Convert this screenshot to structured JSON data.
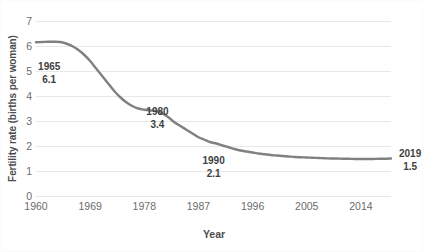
{
  "chart_data": {
    "type": "line",
    "title": "",
    "xlabel": "Year",
    "ylabel": "Fertility rate (births per woman)",
    "xlim": [
      1960,
      2019
    ],
    "ylim": [
      0,
      7
    ],
    "grid": true,
    "legend": false,
    "line_color": "#808080",
    "gridline_color": "#e8e8e8",
    "x_ticks": [
      1960,
      1969,
      1978,
      1987,
      1996,
      2005,
      2014
    ],
    "y_ticks": [
      0,
      1,
      2,
      3,
      4,
      5,
      6,
      7
    ],
    "x": [
      1960,
      1961,
      1962,
      1963,
      1964,
      1965,
      1966,
      1967,
      1968,
      1969,
      1970,
      1971,
      1972,
      1973,
      1974,
      1975,
      1976,
      1977,
      1978,
      1979,
      1980,
      1981,
      1982,
      1983,
      1984,
      1985,
      1986,
      1987,
      1988,
      1989,
      1990,
      1991,
      1992,
      1993,
      1994,
      1995,
      1996,
      1997,
      1998,
      1999,
      2000,
      2001,
      2002,
      2003,
      2004,
      2005,
      2006,
      2007,
      2008,
      2009,
      2010,
      2011,
      2012,
      2013,
      2014,
      2015,
      2016,
      2017,
      2018,
      2019
    ],
    "values": [
      6.15,
      6.16,
      6.17,
      6.17,
      6.16,
      6.1,
      6.0,
      5.85,
      5.65,
      5.4,
      5.1,
      4.8,
      4.5,
      4.2,
      3.95,
      3.75,
      3.6,
      3.5,
      3.45,
      3.42,
      3.4,
      3.3,
      3.15,
      2.95,
      2.8,
      2.65,
      2.5,
      2.35,
      2.25,
      2.15,
      2.1,
      2.02,
      1.95,
      1.88,
      1.82,
      1.78,
      1.74,
      1.7,
      1.67,
      1.64,
      1.62,
      1.6,
      1.58,
      1.56,
      1.55,
      1.54,
      1.53,
      1.52,
      1.51,
      1.5,
      1.5,
      1.49,
      1.49,
      1.48,
      1.48,
      1.48,
      1.48,
      1.49,
      1.49,
      1.5
    ],
    "annotations": [
      {
        "year": "1965",
        "value": "6.1"
      },
      {
        "year": "1980",
        "value": "3.4"
      },
      {
        "year": "1990",
        "value": "2.1"
      },
      {
        "year": "2019",
        "value": "1.5"
      }
    ]
  }
}
